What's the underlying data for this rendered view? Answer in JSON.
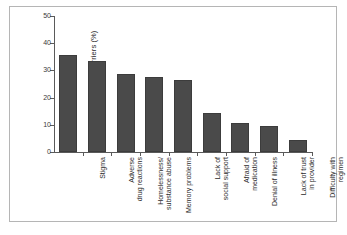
{
  "figure": {
    "border_color": "#b5b5b5",
    "background": "#ffffff"
  },
  "chart_data": {
    "type": "bar",
    "title": "",
    "subtitle": "",
    "xlabel": "",
    "ylabel": "Patients Reporting Barriers (%)",
    "ylim": [
      0,
      50
    ],
    "yticks": [
      0,
      10,
      20,
      30,
      40,
      50
    ],
    "ytick_labels": [
      "0",
      "10",
      "20",
      "30",
      "40",
      "50"
    ],
    "grid": false,
    "legend": null,
    "bar_color": "#4a4a4a",
    "bar_edge_color": "#3c3c3c",
    "axis_color": "#5a5a5a",
    "categories": [
      "Stigma",
      "Adverse\ndrug reactions",
      "Homelessness/\nsubstance abuse",
      "Memory problems",
      "Lack of\nsocial support",
      "Afraid of\nmedication",
      "Denial of illness",
      "Lack of trust\nin provider",
      "Difficulty with\nregimen"
    ],
    "values": [
      35.5,
      33.5,
      28.5,
      27.5,
      26.5,
      14.5,
      10.5,
      9.5,
      4.5
    ]
  }
}
